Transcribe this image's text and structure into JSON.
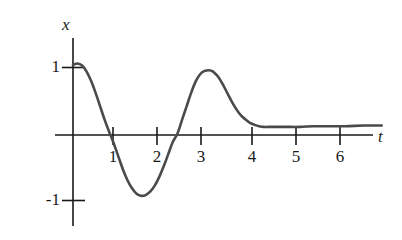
{
  "figure": {
    "background_color": "#ffffff",
    "curve_color": "#4a4a4a",
    "axis_color": "#1a1a1a"
  },
  "axes": {
    "vertical_label": "x",
    "horizontal_label": "t",
    "y_tick_labels": [
      "1",
      "-1"
    ],
    "x_tick_labels": [
      "1",
      "2",
      "3",
      "4",
      "5",
      "6"
    ]
  },
  "chart_data": {
    "type": "line",
    "title": "",
    "xlabel": "t",
    "ylabel": "x",
    "grid": false,
    "legend": null,
    "xlim": [
      0,
      6.8
    ],
    "ylim": [
      -1.35,
      1.45
    ],
    "xticks": [
      1,
      2,
      3,
      4,
      5,
      6
    ],
    "xticklabels": [
      "1",
      "2",
      "3",
      "4",
      "5",
      "6"
    ],
    "yticks": [
      1,
      -1
    ],
    "yticklabels": [
      "1",
      "-1"
    ],
    "annotations": [],
    "series": [
      {
        "name": "x(t)",
        "description": "damped oscillation settling to a small positive steady-state value",
        "x": [
          0.0,
          0.1,
          0.2,
          0.3,
          0.4,
          0.5,
          0.6,
          0.7,
          0.8,
          0.85,
          0.9,
          1.0,
          1.1,
          1.2,
          1.3,
          1.4,
          1.5,
          1.55,
          1.6,
          1.7,
          1.8,
          1.9,
          2.0,
          2.1,
          2.2,
          2.3,
          2.4,
          2.5,
          2.6,
          2.7,
          2.8,
          2.9,
          3.0,
          3.05,
          3.1,
          3.2,
          3.3,
          3.4,
          3.5,
          3.6,
          3.7,
          3.8,
          3.9,
          4.0,
          4.1,
          4.2,
          4.3,
          4.5,
          4.7,
          5.0,
          5.3,
          5.6,
          6.0,
          6.4,
          6.8
        ],
        "y": [
          1.04,
          1.06,
          1.03,
          0.94,
          0.8,
          0.62,
          0.42,
          0.22,
          0.04,
          -0.04,
          -0.13,
          -0.32,
          -0.51,
          -0.67,
          -0.79,
          -0.87,
          -0.9,
          -0.9,
          -0.89,
          -0.84,
          -0.75,
          -0.62,
          -0.46,
          -0.28,
          -0.1,
          0.02,
          0.22,
          0.42,
          0.62,
          0.79,
          0.9,
          0.95,
          0.96,
          0.95,
          0.93,
          0.86,
          0.75,
          0.62,
          0.49,
          0.38,
          0.29,
          0.23,
          0.18,
          0.15,
          0.13,
          0.12,
          0.12,
          0.12,
          0.12,
          0.12,
          0.13,
          0.13,
          0.13,
          0.14,
          0.14
        ]
      }
    ]
  }
}
